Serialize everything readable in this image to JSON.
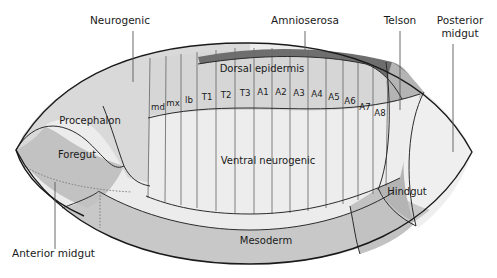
{
  "figure": {
    "colors": {
      "background": "#ffffff",
      "amnioserosa": "#6e6e6e",
      "telson": "#b4b4b4",
      "dorsal_epidermis": "#d6d6d6",
      "ventral_neurogenic": "#ededed",
      "procephalon_neurogenic": "#d9d9d9",
      "foregut": "#c2c2c2",
      "hindgut": "#c2c2c2",
      "mesoderm": "#c8c8c8",
      "anterior_midgut": "#ececec",
      "posterior_midgut": "#efefef",
      "outline": "#1a1a1a",
      "segment_line": "#6b6b6b",
      "leader_line": "#5a5a5a"
    }
  },
  "callouts": [
    {
      "id": "neurogenic",
      "label": "Neurogenic",
      "x": 120,
      "y": 24,
      "anchor": "middle",
      "leader": {
        "x1": 133,
        "y1": 31,
        "x2": 133,
        "y2": 82
      }
    },
    {
      "id": "amnioserosa",
      "label": "Amnioserosa",
      "x": 305,
      "y": 24,
      "anchor": "middle",
      "leader": {
        "x1": 305,
        "y1": 31,
        "x2": 305,
        "y2": 50
      }
    },
    {
      "id": "telson",
      "label": "Telson",
      "x": 400,
      "y": 24,
      "anchor": "middle",
      "leader": {
        "x1": 400,
        "y1": 31,
        "x2": 400,
        "y2": 110
      }
    },
    {
      "id": "posterior-midgut",
      "label": "Posterior",
      "x": 460,
      "y": 24,
      "anchor": "middle",
      "leader": null
    },
    {
      "id": "posterior-midgut-2",
      "label": "midgut",
      "x": 460,
      "y": 37,
      "anchor": "middle",
      "leader": {
        "x1": 453,
        "y1": 44,
        "x2": 453,
        "y2": 152
      }
    },
    {
      "id": "anterior-midgut",
      "label": "Anterior midgut",
      "x": 12,
      "y": 257,
      "anchor": "start",
      "leader": {
        "x1": 55,
        "y1": 249,
        "x2": 55,
        "y2": 182
      }
    }
  ],
  "inner_labels": [
    {
      "id": "dorsal-epidermis",
      "label": "Dorsal epidermis",
      "x": 262,
      "y": 72
    },
    {
      "id": "procephalon",
      "label": "Procephalon",
      "x": 90,
      "y": 124
    },
    {
      "id": "foregut",
      "label": "Foregut",
      "x": 77,
      "y": 158
    },
    {
      "id": "ventral-neurogenic",
      "label": "Ventral neurogenic",
      "x": 268,
      "y": 164
    },
    {
      "id": "hindgut",
      "label": "Hindgut",
      "x": 407,
      "y": 195
    },
    {
      "id": "mesoderm",
      "label": "Mesoderm",
      "x": 266,
      "y": 244
    }
  ],
  "segments": [
    {
      "id": "md",
      "label": "md",
      "x": 158,
      "y": 110
    },
    {
      "id": "mx",
      "label": "mx",
      "x": 173,
      "y": 106
    },
    {
      "id": "lb",
      "label": "lb",
      "x": 189,
      "y": 103
    },
    {
      "id": "T1",
      "label": "T1",
      "x": 207,
      "y": 100
    },
    {
      "id": "T2",
      "label": "T2",
      "x": 226,
      "y": 98
    },
    {
      "id": "T3",
      "label": "T3",
      "x": 245,
      "y": 96
    },
    {
      "id": "A1",
      "label": "A1",
      "x": 263,
      "y": 95
    },
    {
      "id": "A2",
      "label": "A2",
      "x": 281,
      "y": 95
    },
    {
      "id": "A3",
      "label": "A3",
      "x": 299,
      "y": 96
    },
    {
      "id": "A4",
      "label": "A4",
      "x": 317,
      "y": 97
    },
    {
      "id": "A5",
      "label": "A5",
      "x": 334,
      "y": 100
    },
    {
      "id": "A6",
      "label": "A6",
      "x": 350,
      "y": 104
    },
    {
      "id": "A7",
      "label": "A7",
      "x": 365,
      "y": 110
    },
    {
      "id": "A8",
      "label": "A8",
      "x": 380,
      "y": 116
    }
  ],
  "segment_boundaries_x": [
    150,
    166,
    181,
    197,
    216,
    235,
    254,
    272,
    290,
    308,
    326,
    343,
    358,
    373,
    388
  ],
  "diagram_geometry": {
    "left_tip": {
      "x": 16,
      "y": 150
    },
    "right_tip": {
      "x": 472,
      "y": 152
    },
    "top_apex": {
      "x": 250,
      "y": 44
    },
    "bottom_apex": {
      "x": 250,
      "y": 264
    }
  }
}
